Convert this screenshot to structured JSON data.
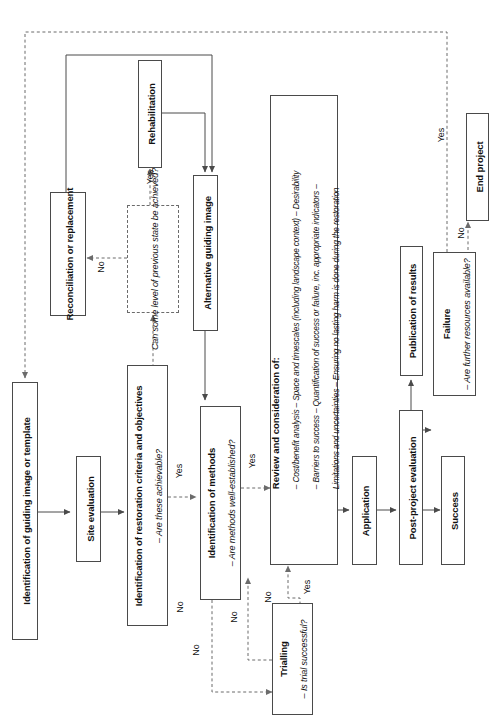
{
  "diagram": {
    "orientation": "rotated-90",
    "stroke_color": "#4a4a4a",
    "dashed_color": "#6b6b6b",
    "background": "#ffffff"
  },
  "nodes": {
    "guiding_image": {
      "title": "Identification of guiding image or template",
      "sub": ""
    },
    "site_evaluation": {
      "title": "Site evaluation",
      "sub": ""
    },
    "restoration_criteria": {
      "title": "Identification of restoration criteria and objectives",
      "sub": "– Are these achievable?"
    },
    "identification_methods": {
      "title": "Identification of methods",
      "sub": "– Are methods well-established?"
    },
    "trialling": {
      "title": "Trialling",
      "sub": "– Is trial successful?"
    },
    "review": {
      "title": "Review and consideration of:",
      "lines": [
        "– Cost/benefit analysis – Space and timescales (including landscape context) – Desirability",
        "– Barriers to success – Quantification of success or failure, inc. appropriate indicators –",
        "Limitations and uncertainties – Ensuring no lasting harm is done during the restoration"
      ]
    },
    "application": {
      "title": "Application",
      "sub": ""
    },
    "post_project_evaluation": {
      "title": "Post-project evaluation",
      "sub": ""
    },
    "publication": {
      "title": "Publication of results",
      "sub": ""
    },
    "success": {
      "title": "Success",
      "sub": ""
    },
    "failure": {
      "title": "Failure",
      "sub": "– Are further resources available?"
    },
    "end_project": {
      "title": "End project",
      "sub": ""
    },
    "previous_state": {
      "title": "",
      "sub": "Can some level of previous state be achieved?"
    },
    "reconciliation": {
      "title": "Reconciliation or replacement",
      "sub": ""
    },
    "rehabilitation": {
      "title": "Rehabilitation",
      "sub": ""
    },
    "alternative_guiding_image": {
      "title": "Alternative guiding image",
      "sub": ""
    }
  },
  "edge_labels": {
    "criteria_yes": "Yes",
    "criteria_no": "No",
    "methods_yes": "Yes",
    "methods_no": "No",
    "trial_yes": "Yes",
    "trial_no": "No",
    "trial_no_back": "No",
    "previous_state_yes": "Yes",
    "previous_state_no": "No",
    "failure_yes": "Yes",
    "failure_no": "No"
  }
}
